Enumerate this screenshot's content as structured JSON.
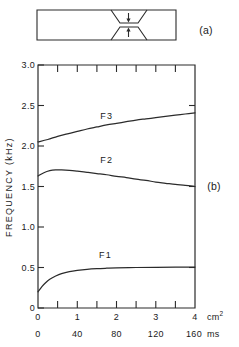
{
  "panels": {
    "a": {
      "label": "(a)",
      "caption_x": 206,
      "caption_y": 30
    },
    "b": {
      "label": "(b)",
      "caption_x": 214,
      "caption_y": 186
    }
  },
  "tube_diagram": {
    "name": "vocal-tract-tube-with-constriction",
    "arrow_up_label": "",
    "arrow_down_label": ""
  },
  "chart_data": {
    "type": "line",
    "title": "",
    "ylabel": "FREQUENCY (kHz)",
    "ylim": [
      0,
      3.0
    ],
    "yticks": [
      0,
      0.5,
      1.0,
      1.5,
      2.0,
      2.5,
      3.0
    ],
    "yticklabels": [
      "0",
      "0.5",
      "1.0",
      "1.5",
      "2.0",
      "2.5",
      "3.0"
    ],
    "xlabel_primary": "cm²",
    "xlabel_secondary": "ms",
    "xlim": [
      0,
      4
    ],
    "xticks": [
      0,
      1,
      2,
      3,
      4
    ],
    "xticklabels": [
      "0",
      "1",
      "2",
      "3",
      "4"
    ],
    "xminorticks": [
      0.5,
      1.5,
      2.5,
      3.5
    ],
    "x2lim": [
      0,
      160
    ],
    "x2ticks": [
      0,
      40,
      80,
      120,
      160
    ],
    "x2ticklabels": [
      "0",
      "40",
      "80",
      "120",
      "160"
    ],
    "grid": false,
    "legend": "inline-labels",
    "series": [
      {
        "name": "F3",
        "label": "F3",
        "label_x": 1.75,
        "label_y": 2.34,
        "x": [
          0.0,
          0.25,
          0.5,
          0.75,
          1.0,
          1.25,
          1.5,
          1.75,
          2.0,
          2.25,
          2.5,
          2.75,
          3.0,
          3.25,
          3.5,
          3.75,
          4.0
        ],
        "y": [
          2.05,
          2.08,
          2.12,
          2.15,
          2.18,
          2.21,
          2.235,
          2.26,
          2.28,
          2.3,
          2.32,
          2.335,
          2.35,
          2.365,
          2.38,
          2.395,
          2.41
        ]
      },
      {
        "name": "F2",
        "label": "F2",
        "label_x": 1.75,
        "label_y": 1.79,
        "x": [
          0.0,
          0.15,
          0.3,
          0.45,
          0.6,
          0.8,
          1.0,
          1.25,
          1.5,
          1.75,
          2.0,
          2.25,
          2.5,
          2.75,
          3.0,
          3.25,
          3.5,
          3.75,
          4.0
        ],
        "y": [
          1.63,
          1.67,
          1.695,
          1.705,
          1.705,
          1.7,
          1.69,
          1.675,
          1.66,
          1.645,
          1.625,
          1.61,
          1.59,
          1.575,
          1.555,
          1.54,
          1.525,
          1.515,
          1.5
        ]
      },
      {
        "name": "F1",
        "label": "F1",
        "label_x": 1.72,
        "label_y": 0.62,
        "x": [
          0.0,
          0.1,
          0.2,
          0.3,
          0.45,
          0.6,
          0.8,
          1.0,
          1.25,
          1.5,
          1.75,
          2.0,
          2.5,
          3.0,
          3.5,
          4.0
        ],
        "y": [
          0.2,
          0.265,
          0.315,
          0.355,
          0.395,
          0.425,
          0.45,
          0.465,
          0.478,
          0.486,
          0.491,
          0.495,
          0.5,
          0.503,
          0.505,
          0.506
        ]
      }
    ]
  }
}
